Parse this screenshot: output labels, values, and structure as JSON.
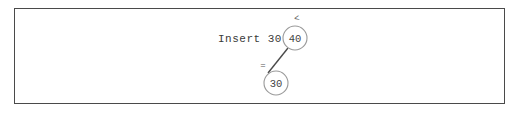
{
  "frame": {
    "border_color": "#4a4a4a",
    "background": "#ffffff"
  },
  "diagram": {
    "type": "binary-search-tree-insert",
    "operation_label": "Insert 30",
    "node_stroke_color": "#9a9a9a",
    "node_text_color": "#444444",
    "edge_color": "#4a4a4a",
    "nodes": [
      {
        "id": "root",
        "label": "40",
        "cx": 295,
        "cy": 38,
        "r": 12,
        "annotation": "<",
        "annotation_x": 297,
        "annotation_y": 19
      },
      {
        "id": "child",
        "label": "30",
        "cx": 276,
        "cy": 83,
        "r": 12,
        "annotation": "=",
        "annotation_x": 263,
        "annotation_y": 66
      }
    ],
    "edges": [
      {
        "from": "root",
        "to": "child",
        "x1": 288,
        "y1": 48,
        "x2": 268,
        "y2": 73
      }
    ]
  }
}
